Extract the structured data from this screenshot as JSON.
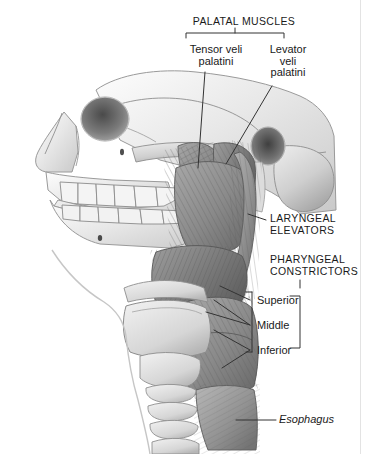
{
  "figure": {
    "style": "grayscale medical illustration",
    "background_color": "#ffffff",
    "line_color": "#333333",
    "frame_color": "#e3e3e3"
  },
  "labels": {
    "palatal_muscles": "PALATAL MUSCLES",
    "tensor_veli_palatini": "Tensor veli\npalatini",
    "levator_veli_palatini": "Levator\nveli\npalatini",
    "laryngeal_elevators": "LARYNGEAL\nELEVATORS",
    "pharyngeal_constrictors": "PHARYNGEAL\nCONSTRICTORS",
    "superior": "Superior",
    "middle": "Middle",
    "inferior": "Inferior",
    "esophagus": "Esophagus"
  },
  "anatomy": {
    "structures": [
      "cranium",
      "orbit",
      "nasal bone",
      "zygomatic arch",
      "maxilla",
      "mandible",
      "maxillary teeth",
      "mandibular teeth",
      "external acoustic meatus",
      "mastoid process",
      "styloid process",
      "tensor veli palatini muscle",
      "levator veli palatini muscle",
      "stylopharyngeus muscle",
      "superior pharyngeal constrictor",
      "middle pharyngeal constrictor",
      "inferior pharyngeal constrictor",
      "hyoid bone",
      "thyroid cartilage",
      "cricoid cartilage",
      "tracheal rings",
      "esophagus"
    ]
  }
}
